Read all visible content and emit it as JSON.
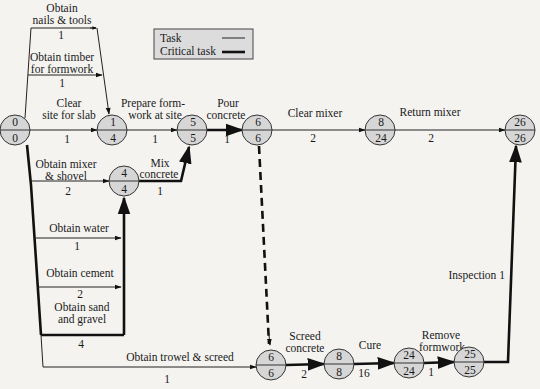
{
  "legend": {
    "task_label": "Task",
    "critical_label": "Critical task"
  },
  "nodes": {
    "n0": {
      "top": "0",
      "bottom": "0"
    },
    "n1": {
      "top": "1",
      "bottom": "4"
    },
    "n5": {
      "top": "5",
      "bottom": "5"
    },
    "n6a": {
      "top": "6",
      "bottom": "6"
    },
    "n8a": {
      "top": "8",
      "bottom": "24"
    },
    "n26": {
      "top": "26",
      "bottom": "26"
    },
    "n4": {
      "top": "4",
      "bottom": "4"
    },
    "n6b": {
      "top": "6",
      "bottom": "6"
    },
    "n8b": {
      "top": "8",
      "bottom": "8"
    },
    "n24": {
      "top": "24",
      "bottom": "24"
    },
    "n25": {
      "top": "25",
      "bottom": "25"
    }
  },
  "tasks": {
    "nails": {
      "line1": "Obtain",
      "line2": "nails & tools",
      "duration": "1",
      "critical": false
    },
    "timber": {
      "line1": "Obtain timber",
      "line2": "for formwork",
      "duration": "1",
      "critical": false
    },
    "clear_site": {
      "line1": "Clear",
      "line2": "site for slab",
      "duration": "1",
      "critical": false
    },
    "prepare": {
      "line1": "Prepare form-",
      "line2": "work at site",
      "duration": "1",
      "critical": false
    },
    "pour": {
      "line1": "Pour",
      "line2": "concrete",
      "duration": "1",
      "critical": true
    },
    "clear_mixer": {
      "line1": "Clear mixer",
      "duration": "2",
      "critical": false
    },
    "return_mixer": {
      "line1": "Return mixer",
      "duration": "2",
      "critical": false
    },
    "mixer": {
      "line1": "Obtain mixer",
      "line2": "& shovel",
      "duration": "2",
      "critical": false
    },
    "mix": {
      "line1": "Mix",
      "line2": "concrete",
      "duration": "1",
      "critical": true
    },
    "water": {
      "line1": "Obtain water",
      "duration": "1",
      "critical": false
    },
    "cement": {
      "line1": "Obtain cement",
      "duration": "2",
      "critical": false
    },
    "sand": {
      "line1": "Obtain sand",
      "line2": "and gravel",
      "duration": "4",
      "critical": true
    },
    "trowel": {
      "line1": "Obtain trowel & screed",
      "duration": "1",
      "critical": false
    },
    "screed": {
      "line1": "Screed",
      "line2": "concrete",
      "duration": "2",
      "critical": true
    },
    "cure": {
      "line1": "Cure",
      "duration": "16",
      "critical": true
    },
    "remove": {
      "line1": "Remove",
      "line2": "formwork",
      "duration": "1",
      "critical": true
    },
    "inspection": {
      "line1": "Inspection 1",
      "critical": true
    }
  },
  "colors": {
    "node_fill": "#d6d6d6",
    "line": "#111111",
    "background": "#f4f3f0"
  }
}
